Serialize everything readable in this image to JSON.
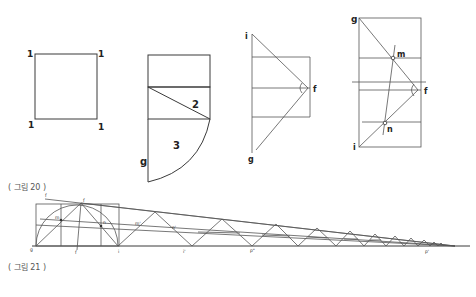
{
  "figure20": {
    "caption": "( 그림 20 )",
    "panel1": {
      "labels": {
        "tl": "1",
        "tr": "1",
        "bl": "1",
        "br": "1"
      }
    },
    "panel2": {
      "labels": {
        "diag": "2",
        "arc": "3",
        "bottom": "g"
      }
    },
    "panel3": {
      "labels": {
        "top": "i",
        "apex": "f",
        "bottom": "g"
      }
    },
    "panel4": {
      "labels": {
        "top": "g",
        "upper_point": "m",
        "apex": "f",
        "lower_point": "n",
        "bottom": "i"
      }
    }
  },
  "figure21": {
    "caption": "( 그림 21 )",
    "labels": {
      "top_left": "f",
      "top": "f",
      "m": "m",
      "n": "n",
      "m_prime": "m'",
      "n_prime": "n'",
      "origin": "g",
      "mid": "f",
      "i": "i",
      "i_prime": "i'",
      "p_double": "p\"",
      "p_prime": "p'"
    }
  },
  "colors": {
    "line": "#3a3a3a",
    "text": "#222222",
    "caption": "#555555"
  }
}
